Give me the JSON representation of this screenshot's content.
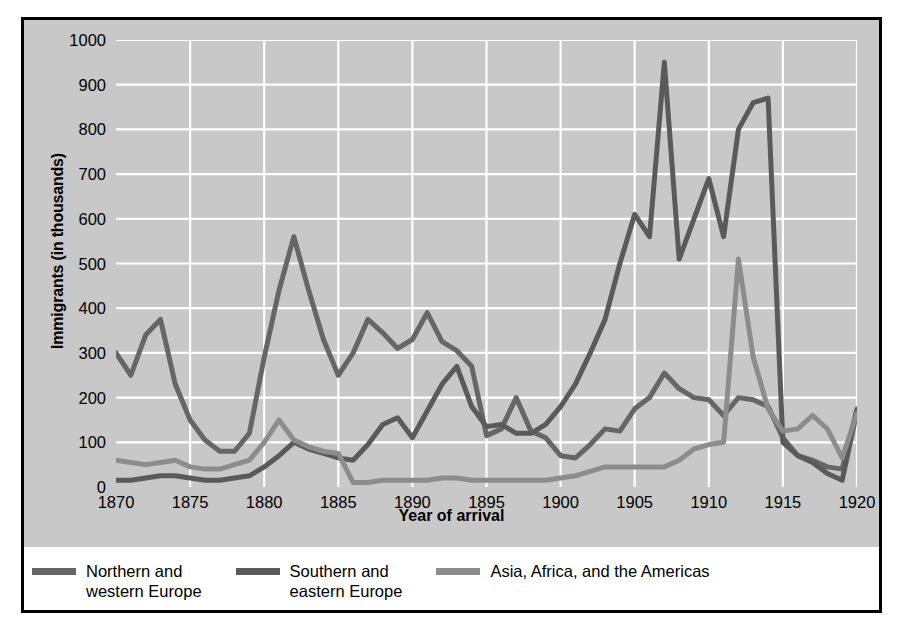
{
  "chart_data": {
    "type": "line",
    "title": "",
    "xlabel": "Year of arrival",
    "ylabel": "Immigrants (in thousands)",
    "xlim": [
      1870,
      1920
    ],
    "ylim": [
      0,
      1000
    ],
    "xticks": [
      1870,
      1875,
      1880,
      1885,
      1890,
      1895,
      1900,
      1905,
      1910,
      1915,
      1920
    ],
    "yticks": [
      0,
      100,
      200,
      300,
      400,
      500,
      600,
      700,
      800,
      900,
      1000
    ],
    "grid": true,
    "grid_color": "#ffffff",
    "plot_background": "#c8c8c8",
    "legend_position": "bottom",
    "x": [
      1870,
      1871,
      1872,
      1873,
      1874,
      1875,
      1876,
      1877,
      1878,
      1879,
      1880,
      1881,
      1882,
      1883,
      1884,
      1885,
      1886,
      1887,
      1888,
      1889,
      1890,
      1891,
      1892,
      1893,
      1894,
      1895,
      1896,
      1897,
      1898,
      1899,
      1900,
      1901,
      1902,
      1903,
      1904,
      1905,
      1906,
      1907,
      1908,
      1909,
      1910,
      1911,
      1912,
      1913,
      1914,
      1915,
      1916,
      1917,
      1918,
      1919,
      1920
    ],
    "series": [
      {
        "name": "Northern and western Europe",
        "color": "#666666",
        "values": [
          300,
          250,
          340,
          375,
          230,
          150,
          105,
          80,
          80,
          120,
          290,
          440,
          560,
          440,
          330,
          250,
          300,
          375,
          345,
          310,
          330,
          390,
          325,
          305,
          270,
          115,
          130,
          200,
          125,
          110,
          70,
          65,
          95,
          130,
          125,
          175,
          200,
          255,
          220,
          200,
          195,
          160,
          200,
          195,
          180,
          110,
          70,
          60,
          45,
          40,
          175
        ],
        "description": "Dark gray line; peaks at 560 in 1882, high values 1870-1893, declines after 1893"
      },
      {
        "name": "Southern and eastern Europe",
        "color": "#5a5a5a",
        "values": [
          15,
          15,
          20,
          25,
          25,
          20,
          15,
          15,
          20,
          25,
          45,
          70,
          100,
          85,
          75,
          65,
          60,
          95,
          140,
          155,
          110,
          170,
          230,
          270,
          180,
          135,
          140,
          120,
          120,
          140,
          180,
          230,
          300,
          375,
          500,
          610,
          560,
          950,
          510,
          600,
          690,
          560,
          800,
          860,
          870,
          100,
          70,
          55,
          30,
          15,
          170
        ],
        "description": "Dark/medium line; dramatic rise after 1900, peaks at 950 in 1907 and 870 in 1914, crashes 1915"
      },
      {
        "name": "Asia, Africa, and the Americas",
        "color": "#8c8c8c",
        "values": [
          60,
          55,
          50,
          55,
          60,
          45,
          40,
          40,
          50,
          60,
          100,
          150,
          105,
          90,
          80,
          75,
          10,
          10,
          15,
          15,
          15,
          15,
          20,
          20,
          15,
          15,
          15,
          15,
          15,
          15,
          20,
          25,
          35,
          45,
          45,
          45,
          45,
          45,
          60,
          85,
          95,
          100,
          510,
          290,
          175,
          125,
          130,
          160,
          130,
          65,
          165
        ],
        "description": "Light gray line; low through 1900, large spike to 510 in 1912"
      }
    ]
  },
  "legend": {
    "items": [
      {
        "label": "Northern and\nwestern Europe",
        "color": "#666666"
      },
      {
        "label": "Southern and\neastern Europe",
        "color": "#5a5a5a"
      },
      {
        "label": "Asia, Africa, and the Americas",
        "color": "#8c8c8c"
      }
    ]
  }
}
